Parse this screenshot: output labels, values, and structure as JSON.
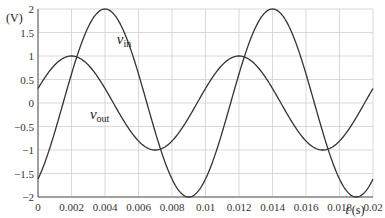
{
  "chart_data": {
    "type": "line",
    "title": "",
    "xlabel": "t (s)",
    "ylabel": "(V)",
    "xlim": [
      0,
      0.02
    ],
    "ylim": [
      -2,
      2
    ],
    "grid": true,
    "x_ticks": [
      "0",
      "0.002",
      "0.004",
      "0.006",
      "0.008",
      "0.01",
      "0.012",
      "0.014",
      "0.016",
      "0.018",
      "0.02"
    ],
    "y_ticks": [
      "-2",
      "-1.5",
      "-1",
      "-0.5",
      "0",
      "0.5",
      "1",
      "1.5",
      "2"
    ],
    "series": [
      {
        "name": "v_in",
        "label_main": "v",
        "label_sub": "in",
        "amplitude": 1,
        "frequency_hz": 100,
        "peak_times": [
          0.002,
          0.012
        ],
        "trough_times": [
          0.007,
          0.017
        ],
        "x": [
          0,
          0.001,
          0.002,
          0.003,
          0.004,
          0.005,
          0.006,
          0.007,
          0.008,
          0.009,
          0.01,
          0.011,
          0.012,
          0.013,
          0.014,
          0.015,
          0.016,
          0.017,
          0.018,
          0.019,
          0.02
        ],
        "values": [
          0.31,
          0.81,
          1.0,
          0.81,
          0.31,
          -0.31,
          -0.81,
          -1.0,
          -0.81,
          -0.31,
          0.31,
          0.81,
          1.0,
          0.81,
          0.31,
          -0.31,
          -0.81,
          -1.0,
          -0.81,
          -0.31,
          0.31
        ]
      },
      {
        "name": "v_out",
        "label_main": "v",
        "label_sub": "out",
        "amplitude": 2,
        "frequency_hz": 100,
        "peak_times": [
          0.004,
          0.014
        ],
        "trough_times": [
          0.009,
          0.019
        ],
        "x": [
          0,
          0.001,
          0.002,
          0.003,
          0.004,
          0.005,
          0.006,
          0.007,
          0.008,
          0.009,
          0.01,
          0.011,
          0.012,
          0.013,
          0.014,
          0.015,
          0.016,
          0.017,
          0.018,
          0.019,
          0.02
        ],
        "values": [
          -1.62,
          -0.62,
          0.62,
          1.62,
          2.0,
          1.62,
          0.62,
          -0.62,
          -1.62,
          -2.0,
          -1.62,
          -0.62,
          0.62,
          1.62,
          2.0,
          1.62,
          0.62,
          -0.62,
          -1.62,
          -2.0,
          -1.62
        ]
      }
    ],
    "annotations": [
      {
        "text": "v_out",
        "x": 0.0047,
        "y": 1.25
      },
      {
        "text": "v_in",
        "x": 0.0031,
        "y": -0.35
      }
    ]
  }
}
